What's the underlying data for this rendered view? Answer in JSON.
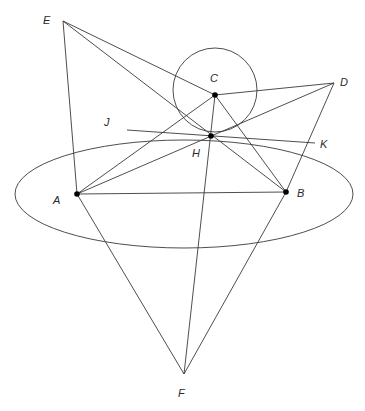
{
  "diagram": {
    "type": "geometric-construction",
    "colors": {
      "line": "#3a3a3a",
      "point": "#000000",
      "label": "#2a2a2a",
      "background": "#ffffff"
    },
    "points": {
      "A": {
        "label": "A",
        "x": 77,
        "y": 194,
        "marked": true
      },
      "B": {
        "label": "B",
        "x": 286,
        "y": 192,
        "marked": true
      },
      "C": {
        "label": "C",
        "x": 215,
        "y": 95,
        "marked": true
      },
      "D": {
        "label": "D",
        "x": 334,
        "y": 83,
        "marked": false
      },
      "E": {
        "label": "E",
        "x": 63,
        "y": 21,
        "marked": false
      },
      "F": {
        "label": "F",
        "x": 184,
        "y": 374,
        "marked": false
      },
      "H": {
        "label": "H",
        "x": 211,
        "y": 136,
        "marked": true
      },
      "J": {
        "label": "J",
        "x": 127,
        "y": 130,
        "marked": false
      },
      "K": {
        "label": "K",
        "x": 315,
        "y": 143,
        "marked": false
      }
    },
    "labels": {
      "A": "A",
      "B": "B",
      "C": "C",
      "D": "D",
      "E": "E",
      "F": "F",
      "H": "H",
      "J": "J",
      "K": "K"
    },
    "segments": [
      [
        "E",
        "A"
      ],
      [
        "E",
        "C"
      ],
      [
        "E",
        "B"
      ],
      [
        "C",
        "D"
      ],
      [
        "D",
        "A"
      ],
      [
        "D",
        "B"
      ],
      [
        "A",
        "C"
      ],
      [
        "A",
        "B"
      ],
      [
        "C",
        "B"
      ],
      [
        "C",
        "F"
      ],
      [
        "A",
        "F"
      ],
      [
        "B",
        "F"
      ],
      [
        "J",
        "K"
      ]
    ],
    "circle": {
      "center": "C",
      "cx": 215,
      "cy": 90,
      "r": 42
    },
    "ellipse": {
      "cx": 184,
      "cy": 194,
      "rx": 169,
      "ry": 54
    }
  }
}
